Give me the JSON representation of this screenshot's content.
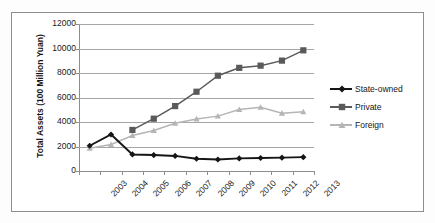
{
  "chart_data": {
    "type": "line",
    "title": "",
    "xlabel": "",
    "ylabel": "Total Assets (100 Million Yuan)",
    "categories": [
      "2003",
      "2004",
      "2005",
      "2006",
      "2007",
      "2008",
      "2009",
      "2010",
      "2011",
      "2012",
      "2013"
    ],
    "ylim": [
      0,
      12000
    ],
    "ytick_labels": [
      "0",
      "2000",
      "4000",
      "6000",
      "8000",
      "10000",
      "12000"
    ],
    "ytick_values": [
      0,
      2000,
      4000,
      6000,
      8000,
      10000,
      12000
    ],
    "grid": "horizontal",
    "legend_position": "right",
    "series": [
      {
        "name": "State-owned",
        "color": "#151515",
        "marker": "diamond",
        "values": [
          2060,
          2980,
          1350,
          1300,
          1230,
          1000,
          940,
          1030,
          1060,
          1090,
          1130
        ]
      },
      {
        "name": "Private",
        "color": "#5a5a5a",
        "marker": "square",
        "values": [
          null,
          null,
          3350,
          4270,
          5300,
          6470,
          7780,
          8420,
          8600,
          9010,
          9850
        ]
      },
      {
        "name": "Foreign",
        "color": "#b5b5b5",
        "marker": "triangle",
        "values": [
          1850,
          2160,
          2900,
          3300,
          3890,
          4250,
          4480,
          5020,
          5200,
          4720,
          4830
        ]
      }
    ]
  },
  "legend": {
    "items": [
      {
        "label": "State-owned"
      },
      {
        "label": "Private"
      },
      {
        "label": "Foreign"
      }
    ]
  }
}
